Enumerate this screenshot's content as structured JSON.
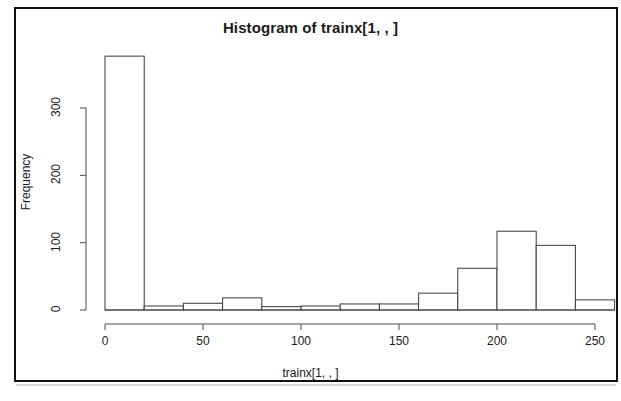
{
  "chart_data": {
    "type": "bar",
    "title": "Histogram of trainx[1, , ]",
    "xlabel": "trainx[1, , ]",
    "ylabel": "Frequency",
    "grid": false,
    "legend": false,
    "xlim": [
      0,
      260
    ],
    "ylim": [
      0,
      380
    ],
    "bin_width": 20,
    "bin_edges": [
      0,
      20,
      40,
      60,
      80,
      100,
      120,
      140,
      160,
      180,
      200,
      220,
      240,
      260
    ],
    "categories": [
      "0-20",
      "20-40",
      "40-60",
      "60-80",
      "80-100",
      "100-120",
      "120-140",
      "140-160",
      "160-180",
      "180-200",
      "200-220",
      "220-240",
      "240-260"
    ],
    "values": [
      377,
      6,
      10,
      18,
      5,
      6,
      9,
      9,
      25,
      62,
      117,
      96,
      15
    ],
    "xticks": [
      0,
      50,
      100,
      150,
      200,
      250
    ],
    "xtick_labels": [
      "0",
      "50",
      "100",
      "150",
      "200",
      "250"
    ],
    "yticks": [
      0,
      100,
      200,
      300
    ],
    "ytick_labels": [
      "0",
      "100",
      "200",
      "300"
    ],
    "bar_fill": "#ffffff",
    "bar_stroke": "#3a3a3a",
    "axis_color": "#4a4a4a",
    "background": "#ffffff"
  },
  "frame": {
    "border_color": "#111111"
  }
}
